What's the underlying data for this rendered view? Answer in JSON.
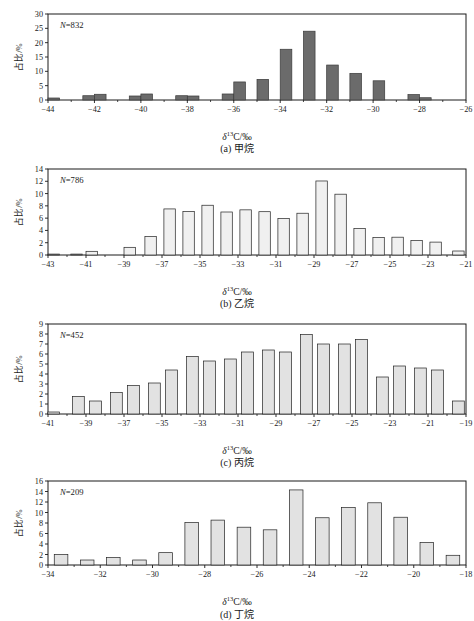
{
  "figure": {
    "axis_label_delta": "δ",
    "axis_label_sup": "13",
    "axis_label_rest": "C/‰",
    "ylabel": "占比/%"
  },
  "chart_data": [
    {
      "type": "bar",
      "panel": "a",
      "caption": "(a) 甲烷",
      "title": "",
      "n_label": "N=832",
      "n_value": 832,
      "xlabel": "δ13C/‰",
      "ylabel": "占比/%",
      "xlim": [
        -44,
        -26
      ],
      "ylim": [
        0,
        30
      ],
      "yticks": [
        0,
        5,
        10,
        15,
        20,
        25,
        30
      ],
      "xticks": [
        -44,
        -42,
        -40,
        -38,
        -36,
        -34,
        -32,
        -30,
        -28,
        -26
      ],
      "bar_color": "#6b6b6b",
      "bar_edge": "#3a3a3a",
      "grid": false,
      "legend": "none",
      "bin_width": 0.5,
      "bin_centers": [
        -43.75,
        -42.25,
        -41.75,
        -40.25,
        -39.75,
        -38.25,
        -37.75,
        -36.25,
        -35.75,
        -34.75,
        -33.75,
        -32.75,
        -31.75,
        -30.75,
        -29.75,
        -28.25,
        -27.75
      ],
      "values": [
        0.7,
        1.5,
        2.0,
        1.4,
        2.1,
        1.5,
        1.4,
        2.1,
        6.3,
        7.2,
        17.7,
        24.0,
        12.2,
        9.3,
        6.7,
        1.9,
        0.8
      ]
    },
    {
      "type": "bar",
      "panel": "b",
      "caption": "(b) 乙烷",
      "title": "",
      "n_label": "N=786",
      "n_value": 786,
      "xlabel": "δ13C/‰",
      "ylabel": "占比/%",
      "xlim": [
        -43,
        -21
      ],
      "ylim": [
        0,
        14
      ],
      "yticks": [
        0,
        2,
        4,
        6,
        8,
        10,
        12,
        14
      ],
      "xticks": [
        -43,
        -41,
        -39,
        -37,
        -35,
        -33,
        -31,
        -29,
        -27,
        -25,
        -23,
        -21
      ],
      "bar_color": "#f0f0f0",
      "bar_edge": "#222222",
      "grid": false,
      "legend": "none",
      "bin_width": 0.6,
      "bin_centers": [
        -42.7,
        -41.5,
        -40.7,
        -38.7,
        -37.6,
        -36.6,
        -35.6,
        -34.6,
        -33.6,
        -32.6,
        -31.6,
        -30.6,
        -29.6,
        -28.6,
        -27.6,
        -26.6,
        -25.6,
        -24.6,
        -23.6,
        -22.6,
        -21.4
      ],
      "values": [
        0.15,
        0.15,
        0.6,
        1.25,
        3.0,
        7.5,
        7.1,
        8.1,
        7.0,
        7.35,
        7.05,
        5.95,
        6.8,
        12.05,
        9.9,
        4.3,
        2.85,
        2.9,
        2.35,
        2.1,
        0.65
      ]
    },
    {
      "type": "bar",
      "panel": "c",
      "caption": "(c) 丙烷",
      "title": "",
      "n_label": "N=452",
      "n_value": 452,
      "xlabel": "δ13C/‰",
      "ylabel": "占比/%",
      "xlim": [
        -41,
        -19
      ],
      "ylim": [
        0,
        9
      ],
      "yticks": [
        0,
        1,
        2,
        3,
        4,
        5,
        6,
        7,
        8,
        9
      ],
      "xticks": [
        -41,
        -39,
        -37,
        -35,
        -33,
        -31,
        -29,
        -27,
        -25,
        -23,
        -21,
        -19
      ],
      "bar_color": "#e2e2e2",
      "bar_edge": "#222222",
      "grid": false,
      "legend": "none",
      "bin_width": 0.62,
      "bin_centers": [
        -40.7,
        -39.4,
        -38.5,
        -37.4,
        -36.5,
        -35.4,
        -34.5,
        -33.4,
        -32.5,
        -31.4,
        -30.5,
        -29.4,
        -28.5,
        -27.4,
        -26.5,
        -25.4,
        -24.5,
        -23.4,
        -22.5,
        -21.4,
        -20.5,
        -19.4
      ],
      "values": [
        0.2,
        1.75,
        1.3,
        2.15,
        2.85,
        3.1,
        4.4,
        5.75,
        5.3,
        5.5,
        6.2,
        6.4,
        6.2,
        7.95,
        7.0,
        7.0,
        7.45,
        3.7,
        4.8,
        4.6,
        4.4,
        1.3
      ]
    },
    {
      "type": "bar",
      "panel": "d",
      "caption": "(d) 丁烷",
      "title": "",
      "n_label": "N=209",
      "n_value": 209,
      "xlabel": "δ13C/‰",
      "ylabel": "占比/%",
      "xlim": [
        -34,
        -18
      ],
      "ylim": [
        0,
        16
      ],
      "yticks": [
        0,
        2,
        4,
        6,
        8,
        10,
        12,
        14,
        16
      ],
      "xticks": [
        -34,
        -32,
        -30,
        -28,
        -26,
        -24,
        -22,
        -20,
        -18
      ],
      "bar_color": "#e2e2e2",
      "bar_edge": "#222222",
      "grid": false,
      "legend": "none",
      "bin_width": 0.52,
      "bin_centers": [
        -33.5,
        -32.5,
        -31.5,
        -30.5,
        -29.5,
        -28.5,
        -27.5,
        -26.5,
        -25.5,
        -24.5,
        -23.5,
        -22.5,
        -21.5,
        -20.5,
        -19.5,
        -18.5
      ],
      "values": [
        2.0,
        0.95,
        1.45,
        0.95,
        2.35,
        8.1,
        8.55,
        7.2,
        6.7,
        14.3,
        9.0,
        10.95,
        11.85,
        9.1,
        4.3,
        1.85
      ]
    }
  ]
}
